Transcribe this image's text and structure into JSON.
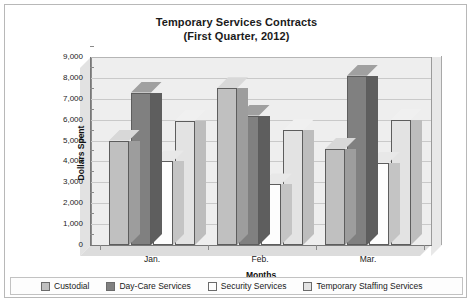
{
  "chart_data": {
    "type": "bar",
    "title": "Temporary Services Contracts",
    "subtitle": "(First Quarter, 2012)",
    "xlabel": "Months",
    "ylabel": "Dollars Spent",
    "categories": [
      "Jan.",
      "Feb.",
      "Mar."
    ],
    "ylim": [
      0,
      9000
    ],
    "ytick_step": 1000,
    "ytick_labels": [
      "0",
      "1,000",
      "2,000",
      "3,000",
      "4,000",
      "5,000",
      "6,000",
      "7,000",
      "8,000",
      "9,000"
    ],
    "grid": true,
    "legend_position": "bottom",
    "projection": "3d-columns",
    "series": [
      {
        "name": "Custodial",
        "color": "#c0c0c0",
        "top_color": "#d8d8d8",
        "side_color": "#9d9d9d",
        "values": [
          5000,
          7500,
          4600
        ]
      },
      {
        "name": "Day-Care Services",
        "color": "#808080",
        "top_color": "#a0a0a0",
        "side_color": "#5e5e5e",
        "values": [
          7300,
          6200,
          8100
        ]
      },
      {
        "name": "Security Services",
        "color": "#fdfdfd",
        "top_color": "#e8e8e8",
        "side_color": "#c4c4c4",
        "values": [
          4000,
          2900,
          3950
        ]
      },
      {
        "name": "Temporary Staffing Services",
        "color": "#e3e3e3",
        "top_color": "#f0f0f0",
        "side_color": "#bdbdbd",
        "values": [
          5950,
          5500,
          6000
        ]
      }
    ]
  }
}
